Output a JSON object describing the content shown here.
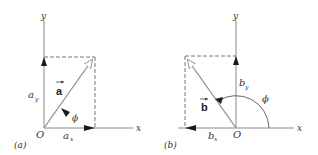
{
  "panels": [
    {
      "id": "a",
      "caption": "(a)",
      "vector_label": "a",
      "axis_x_label": "x",
      "axis_y_label": "y",
      "origin_label": "O",
      "component_x_label": "a",
      "component_x_sub": "x",
      "component_y_label": "a",
      "component_y_sub": "y",
      "angle_label": "ϕ"
    },
    {
      "id": "b",
      "caption": "(b)",
      "vector_label": "b",
      "axis_x_label": "x",
      "axis_y_label": "y",
      "origin_label": "O",
      "component_x_label": "b",
      "component_x_sub": "x",
      "component_y_label": "b",
      "component_y_sub": "y",
      "angle_label": "ϕ"
    }
  ],
  "colors": {
    "axis": "#8a8a8a",
    "vector": "#8a8a8a",
    "arrowhead": "#1a1a1a",
    "dashed": "#777777",
    "text": "#333333"
  }
}
